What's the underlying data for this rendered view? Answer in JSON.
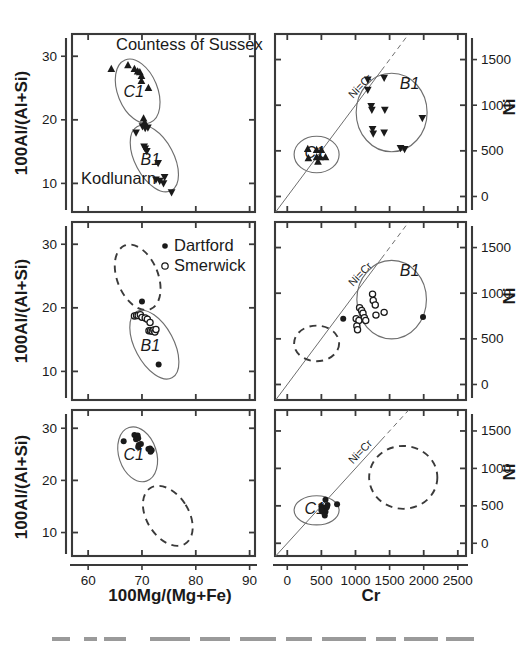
{
  "figure": {
    "width": 528,
    "height": 646,
    "background": "#ffffff",
    "ink_color": "#1a1a1a",
    "ellipse_color": "#6e6e6e"
  },
  "axes": {
    "x_left_title": "100Mg/(Mg+Fe)",
    "x_right_title": "Cr",
    "y_left_title": "100Al/(Al+Si)",
    "y_right_title": "Ni",
    "x_left_ticks": [
      60,
      70,
      80,
      90
    ],
    "x_right_ticks": [
      0,
      500,
      1000,
      1500,
      2000,
      2500
    ],
    "y_left_ticks": [
      10,
      20,
      30
    ],
    "y_right_ticks": [
      0,
      500,
      1000,
      1500
    ],
    "x_left_range": [
      57,
      91
    ],
    "x_right_range": [
      -180,
      2620
    ],
    "y_left_range": [
      5.5,
      33.5
    ],
    "y_right_range": [
      -170,
      1780
    ]
  },
  "annotations": {
    "countess_of_sussex": "Countess of Sussex",
    "kodlunarn": "Kodlunarn",
    "ni_eq_cr": "Ni=Cr",
    "group_c1": "C1",
    "group_b1": "B1"
  },
  "legend": {
    "items": [
      {
        "label": "Dartford",
        "marker": "filled-circle"
      },
      {
        "label": "Smerwick",
        "marker": "open-circle"
      }
    ]
  },
  "chart_data": [
    {
      "id": "panel-row1-left",
      "type": "scatter",
      "title": "",
      "xlabel": "100Mg/(Mg+Fe)",
      "ylabel": "100Al/(Al+Si)",
      "xlim": [
        57,
        91
      ],
      "ylim": [
        5.5,
        33.5
      ],
      "grid": false,
      "legend": "none",
      "annotations": [
        "Countess of Sussex",
        "Kodlunarn",
        "C1",
        "B1"
      ],
      "series": [
        {
          "name": "C1 (up-triangle)",
          "marker": "up-triangle",
          "points": [
            [
              64.3,
              28.0
            ],
            [
              67.4,
              28.6
            ],
            [
              68.6,
              28.0
            ],
            [
              69.2,
              27.6
            ],
            [
              69.6,
              27.5
            ],
            [
              69.9,
              26.9
            ],
            [
              69.9,
              26.1
            ],
            [
              71.2,
              25.0
            ],
            [
              70.3,
              20.2
            ],
            [
              70.5,
              19.6
            ]
          ]
        },
        {
          "name": "B1 (down-triangle)",
          "marker": "down-triangle",
          "points": [
            [
              70.1,
              19.0
            ],
            [
              70.6,
              18.7
            ],
            [
              71.1,
              18.8
            ],
            [
              68.9,
              18.0
            ],
            [
              70.4,
              15.8
            ],
            [
              70.6,
              15.5
            ],
            [
              70.9,
              15.1
            ],
            [
              73.0,
              13.2
            ],
            [
              72.6,
              10.6
            ],
            [
              73.3,
              10.4
            ],
            [
              74.2,
              11.0
            ],
            [
              74.0,
              10.0
            ],
            [
              75.5,
              8.6
            ]
          ]
        }
      ],
      "ellipses": [
        {
          "label": "C1",
          "style": "solid",
          "cx": 69.2,
          "cy": 24.5,
          "rx": 3.7,
          "ry": 5.3,
          "rotation": -22
        },
        {
          "label": "B1",
          "style": "solid",
          "cx": 72.3,
          "cy": 13.9,
          "rx": 3.6,
          "ry": 5.7,
          "rotation": -28
        }
      ]
    },
    {
      "id": "panel-row1-right",
      "type": "scatter",
      "title": "",
      "xlabel": "Cr",
      "ylabel": "Ni",
      "xlim": [
        -180,
        2620
      ],
      "ylim": [
        -170,
        1780
      ],
      "grid": false,
      "legend": "none",
      "annotations": [
        "Ni=Cr",
        "C1",
        "B1"
      ],
      "reference_line": {
        "label": "Ni=Cr",
        "slope": 1,
        "intercept": 0
      },
      "series": [
        {
          "name": "C1 (up-triangle)",
          "marker": "up-triangle",
          "points": [
            [
              300,
              520
            ],
            [
              310,
              420
            ],
            [
              430,
              510
            ],
            [
              430,
              430
            ],
            [
              450,
              380
            ],
            [
              480,
              430
            ],
            [
              500,
              510
            ],
            [
              560,
              430
            ]
          ]
        },
        {
          "name": "B1 (down-triangle)",
          "marker": "down-triangle",
          "points": [
            [
              1180,
              1280
            ],
            [
              1180,
              1170
            ],
            [
              1420,
              1300
            ],
            [
              1230,
              990
            ],
            [
              1240,
              950
            ],
            [
              1430,
              950
            ],
            [
              1250,
              740
            ],
            [
              1260,
              690
            ],
            [
              1420,
              700
            ],
            [
              1660,
              530
            ],
            [
              1720,
              520
            ],
            [
              1980,
              860
            ]
          ]
        }
      ],
      "ellipses": [
        {
          "label": "C1",
          "style": "solid",
          "cx": 430,
          "cy": 460,
          "rx": 330,
          "ry": 200,
          "rotation": 0
        },
        {
          "label": "B1",
          "style": "solid",
          "cx": 1530,
          "cy": 920,
          "rx": 520,
          "ry": 430,
          "rotation": 0
        }
      ]
    },
    {
      "id": "panel-row2-left",
      "type": "scatter",
      "title": "",
      "xlabel": "100Mg/(Mg+Fe)",
      "ylabel": "100Al/(Al+Si)",
      "xlim": [
        57,
        91
      ],
      "ylim": [
        5.5,
        33.5
      ],
      "grid": false,
      "legend": "inside-top-right",
      "annotations": [
        "B1"
      ],
      "series": [
        {
          "name": "Dartford",
          "marker": "filled-circle",
          "points": [
            [
              70.0,
              21.0
            ],
            [
              73.1,
              11.1
            ]
          ]
        },
        {
          "name": "Smerwick",
          "marker": "open-circle",
          "points": [
            [
              68.6,
              18.7
            ],
            [
              69.0,
              18.8
            ],
            [
              69.3,
              18.8
            ],
            [
              69.7,
              18.9
            ],
            [
              70.0,
              18.5
            ],
            [
              70.6,
              18.4
            ],
            [
              71.0,
              18.2
            ],
            [
              71.5,
              17.7
            ],
            [
              71.3,
              16.4
            ],
            [
              71.6,
              16.4
            ],
            [
              71.9,
              16.3
            ],
            [
              72.2,
              16.5
            ],
            [
              72.4,
              16.2
            ],
            [
              72.6,
              16.6
            ]
          ]
        }
      ],
      "ellipses": [
        {
          "label": "C1-reference",
          "style": "dashed",
          "cx": 69.2,
          "cy": 24.8,
          "rx": 3.8,
          "ry": 5.4,
          "rotation": -22
        },
        {
          "label": "B1",
          "style": "solid",
          "cx": 72.3,
          "cy": 14.2,
          "rx": 3.6,
          "ry": 5.9,
          "rotation": -28
        }
      ]
    },
    {
      "id": "panel-row2-right",
      "type": "scatter",
      "title": "",
      "xlabel": "Cr",
      "ylabel": "Ni",
      "xlim": [
        -180,
        2620
      ],
      "ylim": [
        -170,
        1780
      ],
      "grid": false,
      "legend": "none",
      "annotations": [
        "Ni=Cr",
        "B1"
      ],
      "reference_line": {
        "label": "Ni=Cr",
        "slope": 1,
        "intercept": 0
      },
      "series": [
        {
          "name": "Dartford",
          "marker": "filled-circle",
          "points": [
            [
              820,
              720
            ],
            [
              1990,
              740
            ]
          ]
        },
        {
          "name": "Smerwick",
          "marker": "open-circle",
          "points": [
            [
              1250,
              990
            ],
            [
              1260,
              920
            ],
            [
              1060,
              840
            ],
            [
              1090,
              810
            ],
            [
              1110,
              780
            ],
            [
              1010,
              720
            ],
            [
              1050,
              700
            ],
            [
              1130,
              730
            ],
            [
              1150,
              700
            ],
            [
              1300,
              760
            ],
            [
              1420,
              790
            ],
            [
              1020,
              640
            ],
            [
              1030,
              600
            ],
            [
              1290,
              870
            ]
          ]
        }
      ],
      "ellipses": [
        {
          "label": "C1-reference",
          "style": "dashed",
          "cx": 430,
          "cy": 450,
          "rx": 330,
          "ry": 195,
          "rotation": 0
        },
        {
          "label": "B1",
          "style": "solid",
          "cx": 1530,
          "cy": 930,
          "rx": 510,
          "ry": 430,
          "rotation": 0
        }
      ]
    },
    {
      "id": "panel-row3-left",
      "type": "scatter",
      "title": "",
      "xlabel": "100Mg/(Mg+Fe)",
      "ylabel": "100Al/(Al+Si)",
      "xlim": [
        57,
        91
      ],
      "ylim": [
        5.5,
        33.5
      ],
      "grid": false,
      "legend": "none",
      "annotations": [
        "C1"
      ],
      "series": [
        {
          "name": "Dartford",
          "marker": "filled-circle",
          "points": [
            [
              66.6,
              27.5
            ],
            [
              68.6,
              28.7
            ],
            [
              68.9,
              28.5
            ],
            [
              69.2,
              28.6
            ],
            [
              69.3,
              28.1
            ],
            [
              68.9,
              27.9
            ],
            [
              69.4,
              26.8
            ],
            [
              69.8,
              27.0
            ],
            [
              69.3,
              26.4
            ],
            [
              71.2,
              26.0
            ],
            [
              71.5,
              26.1
            ],
            [
              71.8,
              25.8
            ],
            [
              71.6,
              25.5
            ]
          ]
        }
      ],
      "ellipses": [
        {
          "label": "C1",
          "style": "solid",
          "cx": 69.2,
          "cy": 25.0,
          "rx": 3.5,
          "ry": 5.4,
          "rotation": -18
        },
        {
          "label": "B1-reference",
          "style": "dashed",
          "cx": 74.8,
          "cy": 13.2,
          "rx": 3.9,
          "ry": 6.3,
          "rotation": -32
        }
      ]
    },
    {
      "id": "panel-row3-right",
      "type": "scatter",
      "title": "",
      "xlabel": "Cr",
      "ylabel": "Ni",
      "xlim": [
        -180,
        2620
      ],
      "ylim": [
        -170,
        1780
      ],
      "grid": false,
      "legend": "none",
      "annotations": [
        "Ni=Cr",
        "C1"
      ],
      "reference_line": {
        "label": "Ni=Cr",
        "slope": 1,
        "intercept": 0
      },
      "series": [
        {
          "name": "Dartford",
          "marker": "filled-circle",
          "points": [
            [
              560,
              580
            ],
            [
              500,
              490
            ],
            [
              520,
              470
            ],
            [
              540,
              470
            ],
            [
              560,
              460
            ],
            [
              580,
              480
            ],
            [
              540,
              430
            ],
            [
              560,
              420
            ],
            [
              520,
              420
            ],
            [
              550,
              370
            ],
            [
              730,
              520
            ],
            [
              590,
              510
            ],
            [
              500,
              440
            ]
          ]
        }
      ],
      "ellipses": [
        {
          "label": "C1",
          "style": "solid",
          "cx": 430,
          "cy": 440,
          "rx": 330,
          "ry": 195,
          "rotation": 0
        },
        {
          "label": "B1-reference",
          "style": "dashed",
          "cx": 1700,
          "cy": 880,
          "rx": 500,
          "ry": 420,
          "rotation": 0
        }
      ]
    }
  ]
}
